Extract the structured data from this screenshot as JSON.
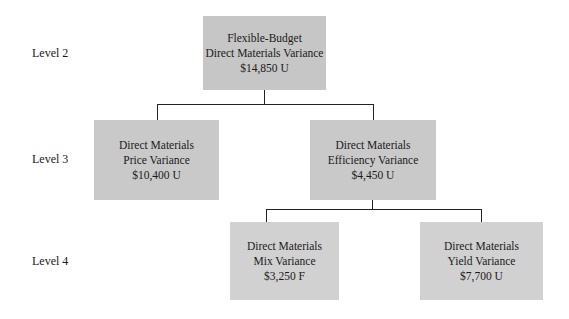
{
  "levels": [
    {
      "label": "Level 2"
    },
    {
      "label": "Level 3"
    },
    {
      "label": "Level 4"
    }
  ],
  "nodes": {
    "root": {
      "line1": "Flexible-Budget",
      "line2": "Direct Materials Variance",
      "amount": "$14,850 U"
    },
    "price": {
      "line1": "Direct Materials",
      "line2": "Price Variance",
      "amount": "$10,400 U"
    },
    "efficiency": {
      "line1": "Direct Materials",
      "line2": "Efficiency Variance",
      "amount": "$4,450 U"
    },
    "mix": {
      "line1": "Direct Materials",
      "line2": "Mix Variance",
      "amount": "$3,250 F"
    },
    "yield": {
      "line1": "Direct Materials",
      "line2": "Yield Variance",
      "amount": "$7,700 U"
    }
  },
  "colors": {
    "box_fill": "#c6c6c6",
    "connector": "#222222"
  }
}
